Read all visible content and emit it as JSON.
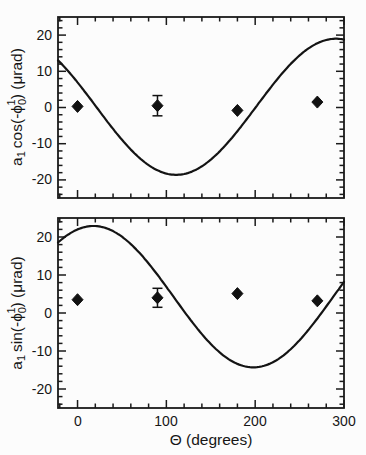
{
  "figure": {
    "background": "#fcfcfc",
    "ink_color": "#1a1a1a",
    "xlabel": "Θ (degrees)",
    "x_ticks": [
      "0",
      "100",
      "200",
      "300"
    ],
    "x_tick_values": [
      0,
      100,
      200,
      300
    ],
    "x_minor_step": 20,
    "xlim": [
      -22,
      300
    ],
    "y_ticks": [
      "20",
      "10",
      "0",
      "-10",
      "-20"
    ],
    "y_tick_values": [
      20,
      10,
      0,
      -10,
      -20
    ],
    "y_minor_step": 2,
    "ylim": [
      -25,
      25
    ],
    "grid": "off",
    "legend": "none"
  },
  "chart_data": [
    {
      "type": "line",
      "panel": "top",
      "ylabel": "a₁ cos(-ϕ₀¹) (μrad)",
      "ylabel_parts": {
        "base": "a",
        "base_sub": "1",
        "fn": "cos(-",
        "sym": "ϕ",
        "sym_sub": "0",
        "sym_sup": "1",
        "suffix": ") (μrad)"
      },
      "curve_model": {
        "offset": 0.2,
        "amplitude": 18.8,
        "peak_deg": 291
      },
      "curve_samples": {
        "x": [
          -22,
          0,
          30,
          60,
          90,
          111,
          150,
          180,
          210,
          240,
          270,
          300
        ],
        "y": [
          13.0,
          6.9,
          -2.7,
          -11.6,
          -17.4,
          -18.6,
          -14.4,
          -6.5,
          3.1,
          12.0,
          17.8,
          18.8
        ]
      },
      "points": {
        "x": [
          0,
          90,
          180,
          270
        ],
        "y": [
          0.3,
          0.5,
          -0.8,
          1.5
        ],
        "yerr": [
          0,
          2.8,
          0,
          0
        ]
      }
    },
    {
      "type": "line",
      "panel": "bottom",
      "ylabel": "a₁ sin(-ϕ₀¹) (μrad)",
      "ylabel_parts": {
        "base": "a",
        "base_sub": "1",
        "fn": "sin(-",
        "sym": "ϕ",
        "sym_sub": "0",
        "sym_sup": "1",
        "suffix": ") (μrad)"
      },
      "curve_model": {
        "offset": 4.3,
        "amplitude": 18.6,
        "peak_deg": 18
      },
      "curve_samples": {
        "x": [
          -22,
          0,
          18,
          60,
          90,
          120,
          150,
          180,
          198,
          240,
          270,
          300
        ],
        "y": [
          18.5,
          22.0,
          22.9,
          18.1,
          10.0,
          0.4,
          -8.1,
          -13.4,
          -14.3,
          -9.5,
          -1.4,
          8.2
        ]
      },
      "points": {
        "x": [
          0,
          90,
          180,
          270
        ],
        "y": [
          3.5,
          4.0,
          5.1,
          3.2
        ],
        "yerr": [
          0,
          2.5,
          0,
          0
        ]
      }
    }
  ]
}
